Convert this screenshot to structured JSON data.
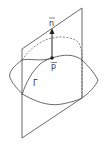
{
  "diagram": {
    "labels": {
      "normal": "n",
      "point": "p",
      "curve": "Γ"
    },
    "colors": {
      "line": "#444444",
      "background": "#ffffff"
    }
  }
}
